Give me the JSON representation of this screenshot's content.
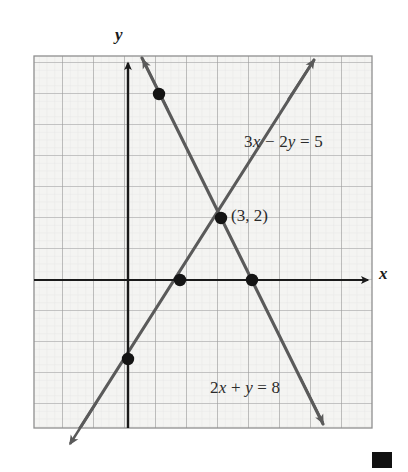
{
  "figure": {
    "kind": "coordinate-plane-graph",
    "background_color": "#ffffff",
    "grid": {
      "fill_color": "#f4f4f2",
      "minor_line_color": "#d8d8d6",
      "major_line_color": "#9a9a9a",
      "border_color": "#8f8f8f",
      "left_px": 34,
      "top_px": 56,
      "right_px": 372,
      "bottom_px": 428,
      "cell_px": 31,
      "columns": 11,
      "rows": 12,
      "origin_px": {
        "x": 128,
        "y": 280
      }
    },
    "axes": {
      "color": "#1a1a1a",
      "x_label": "x",
      "y_label": "y",
      "x_arrow": "right",
      "y_arrow": "up"
    }
  },
  "chart_data": {
    "type": "line",
    "title": "",
    "xlabel": "x",
    "ylabel": "y",
    "xlim": [
      -3,
      8
    ],
    "ylim": [
      -5,
      7
    ],
    "grid": true,
    "legend": "inline-annotations",
    "line_color": "#555555",
    "point_color": "#1a1a1a",
    "series": [
      {
        "name": "3x - 2y = 5",
        "label": "3x − 2y = 5",
        "equation": {
          "a": 3,
          "b": -2,
          "c": 5
        },
        "slope": 1.5,
        "y_intercept": -2.5,
        "x_intercept": 1.6667,
        "label_position": {
          "x": 244,
          "y": 132
        },
        "points": [
          {
            "x": -2.0,
            "y": -5.5
          },
          {
            "x": 6.0,
            "y": 6.5
          }
        ],
        "arrow_ends": [
          "start",
          "end"
        ]
      },
      {
        "name": "2x + y = 8",
        "label": "2x + y = 8",
        "equation": {
          "a": 2,
          "b": 1,
          "c": 8
        },
        "slope": -2,
        "y_intercept": 8,
        "x_intercept": 4,
        "label_position": {
          "x": 210,
          "y": 378
        },
        "points": [
          {
            "x": 0.5,
            "y": 7.0
          },
          {
            "x": 6.3,
            "y": -4.6
          }
        ],
        "arrow_ends": [
          "start",
          "end"
        ]
      }
    ],
    "marked_points": [
      {
        "x": 1,
        "y": 6,
        "on": "2x + y = 8",
        "px": {
          "x": 159,
          "y": 94
        }
      },
      {
        "x": 1.6667,
        "y": 0,
        "on": "3x - 2y = 5",
        "px": {
          "x": 180,
          "y": 280
        }
      },
      {
        "x": 3,
        "y": 2,
        "on": "intersection",
        "px": {
          "x": 221,
          "y": 218
        }
      },
      {
        "x": 4,
        "y": 0,
        "on": "2x + y = 8",
        "px": {
          "x": 252,
          "y": 280
        }
      },
      {
        "x": 0,
        "y": -2.5,
        "on": "3x - 2y = 5",
        "px": {
          "x": 128,
          "y": 359
        }
      }
    ],
    "annotations": [
      {
        "text": "(3, 2)",
        "kind": "intersection-label",
        "data_x": 3,
        "data_y": 2,
        "px": {
          "x": 231,
          "y": 206
        }
      }
    ]
  },
  "end_marker": {
    "shape": "filled-square",
    "color": "#111111",
    "px": {
      "x": 372,
      "y": 452,
      "w": 20,
      "h": 16
    }
  }
}
